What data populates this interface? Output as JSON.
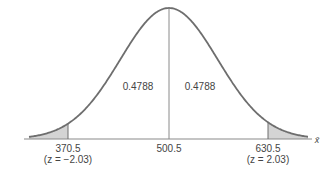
{
  "diagram": {
    "type": "normal-distribution",
    "mean_label": "500.5",
    "left_cut": {
      "value_label": "370.5",
      "z_label": "(z = −2.03)",
      "z": -2.03
    },
    "right_cut": {
      "value_label": "630.5",
      "z_label": "(z = 2.03)",
      "z": 2.03
    },
    "left_area_label": "0.4788",
    "right_area_label": "0.4788",
    "axis_label": "x̄",
    "colors": {
      "curve": "#6e6e6e",
      "axis": "#8a8a8a",
      "shade": "#d4d4d4",
      "text": "#444444"
    }
  }
}
